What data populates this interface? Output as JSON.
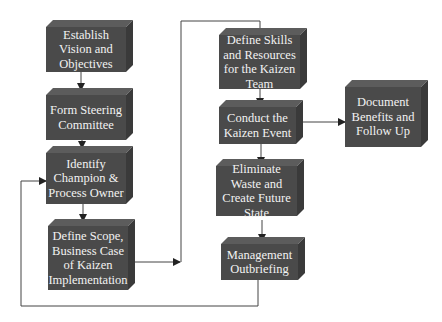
{
  "diagram": {
    "type": "flowchart",
    "colors": {
      "box_fill": "#4a4a4a",
      "box_top": "#5c5c5c",
      "box_side": "#3a3a3a",
      "text": "#f2f2f2",
      "line": "#333333"
    },
    "nodes": [
      {
        "id": "establish-vision",
        "label": "Establish Vision and Objectives"
      },
      {
        "id": "form-steering",
        "label": "Form Steering Committee"
      },
      {
        "id": "identify-champion",
        "label": "Identify Champion & Process Owner"
      },
      {
        "id": "define-scope",
        "label": "Define Scope, Business Case of Kaizen Implementation"
      },
      {
        "id": "define-skills",
        "label": "Define Skills and Resources for the Kaizen Team"
      },
      {
        "id": "conduct-event",
        "label": "Conduct the Kaizen Event"
      },
      {
        "id": "eliminate-waste",
        "label": "Eliminate Waste and Create Future State"
      },
      {
        "id": "management-outbriefing",
        "label": "Management Outbriefing"
      },
      {
        "id": "document-benefits",
        "label": "Document Benefits and Follow Up"
      }
    ],
    "edges": [
      {
        "from": "establish-vision",
        "to": "form-steering"
      },
      {
        "from": "form-steering",
        "to": "identify-champion"
      },
      {
        "from": "identify-champion",
        "to": "define-scope"
      },
      {
        "from": "define-scope",
        "to": "define-skills"
      },
      {
        "from": "define-skills",
        "to": "conduct-event"
      },
      {
        "from": "conduct-event",
        "to": "document-benefits"
      },
      {
        "from": "conduct-event",
        "to": "eliminate-waste"
      },
      {
        "from": "eliminate-waste",
        "to": "management-outbriefing"
      },
      {
        "from": "management-outbriefing",
        "to": "identify-champion"
      }
    ]
  }
}
